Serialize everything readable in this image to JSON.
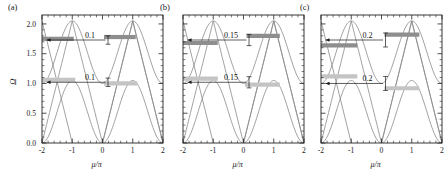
{
  "figure": {
    "type": "multi-panel-line-chart",
    "panel_count": 3,
    "background": "#ffffff",
    "curve_color": "#8a8a8a",
    "band_dark_color": "#8e8e8e",
    "band_light_color": "#c4c4c4",
    "axis_color": "#222222"
  },
  "axes": {
    "x": {
      "label": "μ/π",
      "ticks": [
        "-2",
        "-1",
        "0",
        "1",
        "2"
      ],
      "tick_values": [
        -2,
        -1,
        0,
        1,
        2
      ],
      "min": -2,
      "max": 2,
      "minor_per_interval": 4
    },
    "y": {
      "label": "Ω",
      "ticks": [
        "0.0",
        "0.5",
        "1.0",
        "1.5",
        "2.0"
      ],
      "tick_values": [
        0.0,
        0.5,
        1.0,
        1.5,
        2.0
      ],
      "min": 0.0,
      "max": 2.15,
      "minor_per_interval": 4,
      "shown_on_panel": "a"
    }
  },
  "panels": [
    {
      "id": "a",
      "label": "(a)",
      "gap_label_upper": "0.1",
      "gap_label_lower": "0.1",
      "gap_value": 0.1,
      "upper_band_center": 1.73,
      "lower_band_center": 1.04,
      "show_y_axis": true
    },
    {
      "id": "b",
      "label": "(b)",
      "gap_label_upper": "0.15",
      "gap_label_lower": "0.15",
      "gap_value": 0.15,
      "upper_band_center": 1.73,
      "lower_band_center": 1.02,
      "show_y_axis": false
    },
    {
      "id": "c",
      "label": "(c)",
      "gap_label_upper": "0.2",
      "gap_label_lower": "0.2",
      "gap_value": 0.2,
      "upper_band_center": 1.73,
      "lower_band_center": 1.0,
      "show_y_axis": false
    }
  ],
  "chart_data": {
    "type": "line",
    "title": "",
    "xlabel": "μ/π",
    "ylabel": "Ω",
    "xlim": [
      -2,
      2
    ],
    "ylim": [
      0.0,
      2.15
    ],
    "xticks": [
      -2,
      -1,
      0,
      1,
      2
    ],
    "yticks": [
      0.0,
      0.5,
      1.0,
      1.5,
      2.0
    ],
    "grid": false,
    "legend": null,
    "panels": [
      {
        "panel": "a",
        "label": "(a)",
        "annotations": [
          {
            "text": "0.1",
            "x": -0.35,
            "y": 1.73,
            "kind": "gap-measure-upper"
          },
          {
            "text": "0.1",
            "x": -0.35,
            "y": 1.02,
            "kind": "gap-measure-lower"
          }
        ],
        "flat_bands": [
          {
            "style": "dark",
            "y": 1.75,
            "x_start": -2.0,
            "x_end": -0.95
          },
          {
            "style": "dark",
            "y": 1.78,
            "x_start": 0.05,
            "x_end": 1.1
          },
          {
            "style": "light",
            "y": 1.06,
            "x_start": -2.0,
            "x_end": -0.9
          },
          {
            "style": "light",
            "y": 1.0,
            "x_start": 0.05,
            "x_end": 1.15
          }
        ],
        "series": [
          {
            "name": "upper-arc-left",
            "comment": "cosine dome peaking near 2.05 at mu/pi=-1"
          },
          {
            "name": "upper-arc-right",
            "comment": "cosine dome peaking near 2.05 at mu/pi=+1"
          },
          {
            "name": "V-branch-left",
            "comment": "linear branches crossing near Omega=1"
          },
          {
            "name": "V-branch-right",
            "comment": "linear branches crossing near Omega=1"
          }
        ]
      },
      {
        "panel": "b",
        "label": "(b)",
        "annotations": [
          {
            "text": "0.15",
            "x": -0.35,
            "y": 1.73,
            "kind": "gap-measure-upper"
          },
          {
            "text": "0.15",
            "x": -0.35,
            "y": 1.02,
            "kind": "gap-measure-lower"
          }
        ],
        "flat_bands": [
          {
            "style": "dark",
            "y": 1.68,
            "x_start": -2.0,
            "x_end": -0.85
          },
          {
            "style": "dark",
            "y": 1.8,
            "x_start": 0.1,
            "x_end": 1.2
          },
          {
            "style": "light",
            "y": 1.08,
            "x_start": -2.0,
            "x_end": -0.85
          },
          {
            "style": "light",
            "y": 0.98,
            "x_start": 0.05,
            "x_end": 1.2
          }
        ],
        "series": [
          {
            "name": "upper-arc-left"
          },
          {
            "name": "upper-arc-right"
          },
          {
            "name": "V-branch-left"
          },
          {
            "name": "V-branch-right"
          }
        ]
      },
      {
        "panel": "c",
        "label": "(c)",
        "annotations": [
          {
            "text": "0.2",
            "x": -0.4,
            "y": 1.73,
            "kind": "gap-measure-upper"
          },
          {
            "text": "0.2",
            "x": -0.4,
            "y": 1.0,
            "kind": "gap-measure-lower"
          }
        ],
        "flat_bands": [
          {
            "style": "dark",
            "y": 1.64,
            "x_start": -2.0,
            "x_end": -0.8
          },
          {
            "style": "dark",
            "y": 1.82,
            "x_start": 0.1,
            "x_end": 1.25
          },
          {
            "style": "light",
            "y": 1.12,
            "x_start": -2.0,
            "x_end": -0.8
          },
          {
            "style": "light",
            "y": 0.92,
            "x_start": 0.1,
            "x_end": 1.25
          }
        ],
        "series": [
          {
            "name": "upper-arc-left"
          },
          {
            "name": "upper-arc-right"
          },
          {
            "name": "V-branch-left"
          },
          {
            "name": "V-branch-right"
          }
        ]
      }
    ]
  }
}
